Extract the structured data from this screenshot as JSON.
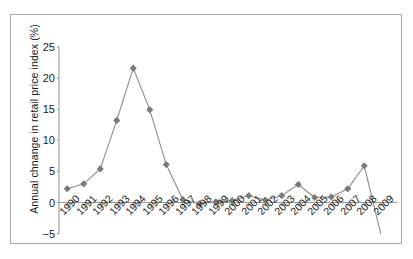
{
  "chart_data": {
    "type": "line",
    "title": "",
    "xlabel": "",
    "ylabel": "Annual chnange in retail price index (%)",
    "categories": [
      "1990",
      "1991",
      "1992",
      "1993",
      "1994",
      "1995",
      "1996",
      "1997",
      "1998",
      "1999",
      "2000",
      "2001",
      "2002",
      "2003",
      "2004",
      "2005",
      "2006",
      "2007",
      "2008",
      "2009"
    ],
    "values": [
      2.2,
      3.0,
      5.4,
      13.2,
      21.6,
      14.9,
      6.1,
      0.5,
      -0.2,
      0.1,
      0.3,
      1.1,
      0.4,
      1.1,
      2.9,
      0.8,
      0.9,
      2.2,
      5.9,
      -5.0
    ],
    "ylim": [
      -5,
      25
    ],
    "yticks": [
      25,
      20,
      15,
      10,
      5,
      0,
      -5
    ],
    "ytick_labels": [
      "25",
      "20",
      "15",
      "10",
      "5",
      "0",
      "−5"
    ],
    "grid": false,
    "legend": false,
    "marker": "diamond",
    "series": [
      {
        "name": "Annual change in retail price index (%)",
        "values": [
          2.2,
          3.0,
          5.4,
          13.2,
          21.6,
          14.9,
          6.1,
          0.5,
          -0.2,
          0.1,
          0.3,
          1.1,
          0.4,
          1.1,
          2.9,
          0.8,
          0.9,
          2.2,
          5.9,
          -5.0
        ]
      }
    ],
    "colors": {
      "line": "#8c8c8c",
      "marker": "#7a7a7a",
      "axis": "#9a9a9a",
      "frame": "#a8a8a8",
      "text": "#1a1a1a"
    }
  }
}
